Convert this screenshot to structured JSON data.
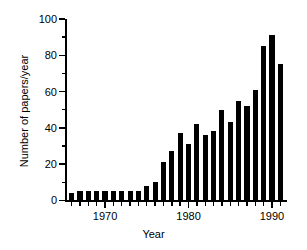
{
  "chart_data": {
    "type": "bar",
    "title": "",
    "subtitle": "",
    "xlabel": "Year",
    "ylabel": "Number of papers/year",
    "xlim": [
      1965.2,
      1991.8
    ],
    "ylim": [
      0,
      100
    ],
    "grid": false,
    "legend": null,
    "bar_color": "#000000",
    "axis_color": "#000000",
    "background": "#ffffff",
    "y_ticks_major": [
      0,
      20,
      40,
      60,
      80,
      100
    ],
    "y_ticks_minor": [
      10,
      30,
      50,
      70,
      90
    ],
    "y_tick_labels": [
      "0",
      "20",
      "40",
      "60",
      "80",
      "100"
    ],
    "x_ticks_major": [
      1970,
      1980,
      1990
    ],
    "x_tick_labels": [
      "1970",
      "1980",
      "1990"
    ],
    "x_ticks_minor": [
      1966,
      1967,
      1968,
      1969,
      1971,
      1972,
      1973,
      1974,
      1975,
      1976,
      1977,
      1978,
      1979,
      1981,
      1982,
      1983,
      1984,
      1985,
      1986,
      1987,
      1988,
      1989,
      1991
    ],
    "categories": [
      1966,
      1967,
      1968,
      1969,
      1970,
      1971,
      1972,
      1973,
      1974,
      1975,
      1976,
      1977,
      1978,
      1979,
      1980,
      1981,
      1982,
      1983,
      1984,
      1985,
      1986,
      1987,
      1988,
      1989,
      1990,
      1991
    ],
    "values": [
      4,
      5,
      5,
      5,
      5,
      5,
      5,
      5,
      5,
      8,
      10,
      21,
      27,
      37,
      31,
      42,
      36,
      38,
      50,
      43,
      55,
      52,
      61,
      85,
      91,
      75
    ],
    "series": [
      {
        "name": "Number of papers/year",
        "values": [
          4,
          5,
          5,
          5,
          5,
          5,
          5,
          5,
          5,
          8,
          10,
          21,
          27,
          37,
          31,
          42,
          36,
          38,
          50,
          43,
          55,
          52,
          61,
          85,
          91,
          75
        ]
      }
    ]
  }
}
